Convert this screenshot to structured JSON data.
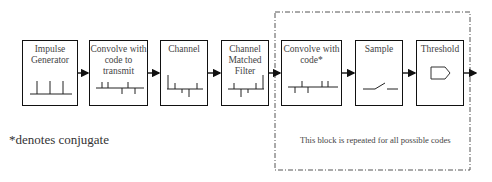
{
  "diagram": {
    "type": "block-diagram",
    "blocks": [
      {
        "id": "impulse-generator",
        "label": "Impulse\nGenerator",
        "icon": "impulse-train-icon"
      },
      {
        "id": "convolve-transmit",
        "label": "Convolve with\ncode to\ntransmit",
        "icon": "code-sequence-icon"
      },
      {
        "id": "channel",
        "label": "Channel",
        "icon": "channel-response-icon"
      },
      {
        "id": "channel-matched-filter",
        "label": "Channel\nMatched\nFilter",
        "icon": "matched-filter-response-icon"
      },
      {
        "id": "convolve-code-conjugate",
        "label": "Convolve with\ncode*",
        "icon": "conjugate-code-sequence-icon"
      },
      {
        "id": "sample",
        "label": "Sample",
        "icon": "switch-icon"
      },
      {
        "id": "threshold",
        "label": "Threshold",
        "icon": "comparator-icon"
      }
    ],
    "edges": [
      [
        "impulse-generator",
        "convolve-transmit"
      ],
      [
        "convolve-transmit",
        "channel"
      ],
      [
        "channel",
        "channel-matched-filter"
      ],
      [
        "channel-matched-filter",
        "convolve-code-conjugate"
      ],
      [
        "convolve-code-conjugate",
        "sample"
      ],
      [
        "sample",
        "threshold"
      ],
      [
        "threshold",
        "output"
      ]
    ],
    "repeated_group": {
      "members": [
        "convolve-code-conjugate",
        "sample",
        "threshold"
      ],
      "border_style": "dash-dot",
      "note": "This block is repeated for all possible codes"
    },
    "footnote": "*denotes conjugate"
  },
  "colors": {
    "stroke": "#111111",
    "text": "#444444",
    "background": "#ffffff"
  }
}
